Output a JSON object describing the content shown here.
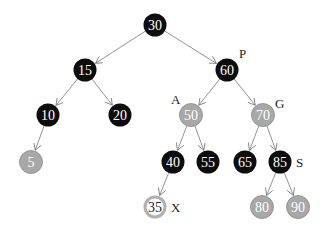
{
  "diagram": {
    "type": "red-black-tree",
    "colors": {
      "black": "#0d0d0d",
      "red": "#a8a8a8",
      "red_stroke": "#8a8a8a",
      "new_fill": "#ffffff",
      "new_stroke": "#b0b0b0",
      "edge": "#777777"
    },
    "nodes": [
      {
        "id": "n30",
        "value": "30",
        "x": 155,
        "y": 25,
        "color": "black"
      },
      {
        "id": "n15",
        "value": "15",
        "x": 85,
        "y": 70,
        "color": "black"
      },
      {
        "id": "n60",
        "value": "60",
        "x": 227,
        "y": 70,
        "color": "black",
        "label": "P"
      },
      {
        "id": "n10",
        "value": "10",
        "x": 48,
        "y": 115,
        "color": "black"
      },
      {
        "id": "n20",
        "value": "20",
        "x": 120,
        "y": 115,
        "color": "black"
      },
      {
        "id": "n50",
        "value": "50",
        "x": 191,
        "y": 115,
        "color": "red",
        "label": "A"
      },
      {
        "id": "n70",
        "value": "70",
        "x": 263,
        "y": 115,
        "color": "red",
        "label": "G"
      },
      {
        "id": "n5",
        "value": "5",
        "x": 31,
        "y": 162,
        "color": "red"
      },
      {
        "id": "n40",
        "value": "40",
        "x": 173,
        "y": 162,
        "color": "black"
      },
      {
        "id": "n55",
        "value": "55",
        "x": 208,
        "y": 162,
        "color": "black"
      },
      {
        "id": "n65",
        "value": "65",
        "x": 245,
        "y": 162,
        "color": "black"
      },
      {
        "id": "n85",
        "value": "85",
        "x": 280,
        "y": 162,
        "color": "black",
        "label": "S"
      },
      {
        "id": "n35",
        "value": "35",
        "x": 155,
        "y": 207,
        "color": "new",
        "label": "X"
      },
      {
        "id": "n80",
        "value": "80",
        "x": 262,
        "y": 207,
        "color": "red"
      },
      {
        "id": "n90",
        "value": "90",
        "x": 298,
        "y": 207,
        "color": "red"
      }
    ],
    "edges": [
      [
        "n30",
        "n15"
      ],
      [
        "n30",
        "n60"
      ],
      [
        "n15",
        "n10"
      ],
      [
        "n15",
        "n20"
      ],
      [
        "n60",
        "n50"
      ],
      [
        "n60",
        "n70"
      ],
      [
        "n10",
        "n5"
      ],
      [
        "n50",
        "n40"
      ],
      [
        "n50",
        "n55"
      ],
      [
        "n70",
        "n65"
      ],
      [
        "n70",
        "n85"
      ],
      [
        "n40",
        "n35"
      ],
      [
        "n85",
        "n80"
      ],
      [
        "n85",
        "n90"
      ]
    ],
    "labels": {
      "P": "P",
      "A": "A",
      "G": "G",
      "S": "S",
      "X": "X"
    }
  }
}
